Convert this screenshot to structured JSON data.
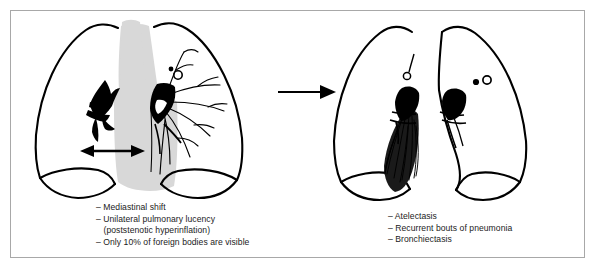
{
  "figure": {
    "type": "medical-illustration",
    "border_color": "#a8a8a8",
    "background_color": "#ffffff"
  },
  "colors": {
    "ink": "#000000",
    "text": "#1b1b1b",
    "mediastinum_gray": "#d8d8d8",
    "frame": "#a8a8a8"
  },
  "panels": [
    {
      "id": "acute-findings",
      "position": "left",
      "name": "chest-diagram-acute",
      "description": "Frontal chest outline with both lungs, gray mediastinal shadow shifted to the right, black obstructing foreign body in the left main bronchus with white foreign body visible, branching bronchial tree, and a horizontal double-headed arrow marking mediastinal shift",
      "elements": [
        "right-lung-outline",
        "left-lung-outline",
        "mediastinum-shadow",
        "trachea-band",
        "right-hilum-bronchus",
        "left-hilum-obstruction",
        "foreign-body",
        "bronchial-tree",
        "mediastinal-shift-arrow"
      ]
    },
    {
      "id": "late-complications",
      "position": "right",
      "name": "chest-diagram-complications",
      "description": "Frontal chest outline showing a collapsed, shrunken left lung with dense hatched atelectatic fan at the base, retained hilar foreign body, and nodular opacities in the opposite hilum",
      "elements": [
        "right-lung-outline",
        "left-lung-outline-collapsed",
        "atelectasis-fan",
        "hilar-foreign-body",
        "nodular-opacities"
      ]
    }
  ],
  "arrow": {
    "name": "progression-arrow",
    "direction": "right",
    "meaning": "progresses to"
  },
  "captions": {
    "left": {
      "lines": [
        {
          "text": "– Mediastinal shift",
          "indent": false
        },
        {
          "text": "– Unilateral pulmonary lucency",
          "indent": false
        },
        {
          "text": "(poststenotic hyperinflation)",
          "indent": true
        },
        {
          "text": "– Only 10% of foreign bodies are visible",
          "indent": false
        }
      ]
    },
    "right": {
      "lines": [
        {
          "text": "– Atelectasis",
          "indent": false
        },
        {
          "text": "– Recurrent bouts of pneumonia",
          "indent": false
        },
        {
          "text": "– Bronchiectasis",
          "indent": false
        }
      ]
    }
  }
}
